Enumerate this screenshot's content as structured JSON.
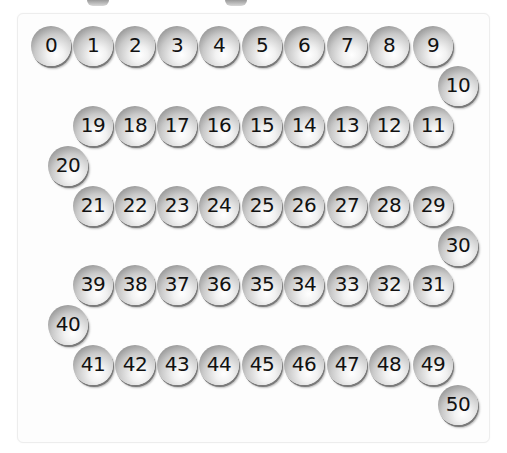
{
  "balls": [
    {
      "n": "0",
      "x": 51,
      "y": 46
    },
    {
      "n": "1",
      "x": 93,
      "y": 46
    },
    {
      "n": "2",
      "x": 135,
      "y": 46
    },
    {
      "n": "3",
      "x": 177,
      "y": 46
    },
    {
      "n": "4",
      "x": 219,
      "y": 46
    },
    {
      "n": "5",
      "x": 262,
      "y": 46
    },
    {
      "n": "6",
      "x": 304,
      "y": 46
    },
    {
      "n": "7",
      "x": 347,
      "y": 46
    },
    {
      "n": "8",
      "x": 389,
      "y": 46
    },
    {
      "n": "9",
      "x": 433,
      "y": 46
    },
    {
      "n": "10",
      "x": 458,
      "y": 86
    },
    {
      "n": "11",
      "x": 433,
      "y": 126
    },
    {
      "n": "12",
      "x": 389,
      "y": 126
    },
    {
      "n": "13",
      "x": 347,
      "y": 126
    },
    {
      "n": "14",
      "x": 304,
      "y": 126
    },
    {
      "n": "15",
      "x": 262,
      "y": 126
    },
    {
      "n": "16",
      "x": 219,
      "y": 126
    },
    {
      "n": "17",
      "x": 177,
      "y": 126
    },
    {
      "n": "18",
      "x": 135,
      "y": 126
    },
    {
      "n": "19",
      "x": 93,
      "y": 126
    },
    {
      "n": "20",
      "x": 68,
      "y": 166
    },
    {
      "n": "21",
      "x": 93,
      "y": 206
    },
    {
      "n": "22",
      "x": 135,
      "y": 206
    },
    {
      "n": "23",
      "x": 177,
      "y": 206
    },
    {
      "n": "24",
      "x": 219,
      "y": 206
    },
    {
      "n": "25",
      "x": 262,
      "y": 206
    },
    {
      "n": "26",
      "x": 304,
      "y": 206
    },
    {
      "n": "27",
      "x": 347,
      "y": 206
    },
    {
      "n": "28",
      "x": 389,
      "y": 206
    },
    {
      "n": "29",
      "x": 433,
      "y": 206
    },
    {
      "n": "30",
      "x": 458,
      "y": 246
    },
    {
      "n": "31",
      "x": 433,
      "y": 285
    },
    {
      "n": "32",
      "x": 389,
      "y": 285
    },
    {
      "n": "33",
      "x": 347,
      "y": 285
    },
    {
      "n": "34",
      "x": 304,
      "y": 285
    },
    {
      "n": "35",
      "x": 262,
      "y": 285
    },
    {
      "n": "36",
      "x": 219,
      "y": 285
    },
    {
      "n": "37",
      "x": 177,
      "y": 285
    },
    {
      "n": "38",
      "x": 135,
      "y": 285
    },
    {
      "n": "39",
      "x": 93,
      "y": 285
    },
    {
      "n": "40",
      "x": 68,
      "y": 325
    },
    {
      "n": "41",
      "x": 93,
      "y": 365
    },
    {
      "n": "42",
      "x": 135,
      "y": 365
    },
    {
      "n": "43",
      "x": 177,
      "y": 365
    },
    {
      "n": "44",
      "x": 219,
      "y": 365
    },
    {
      "n": "45",
      "x": 262,
      "y": 365
    },
    {
      "n": "46",
      "x": 304,
      "y": 365
    },
    {
      "n": "47",
      "x": 347,
      "y": 365
    },
    {
      "n": "48",
      "x": 389,
      "y": 365
    },
    {
      "n": "49",
      "x": 433,
      "y": 365
    },
    {
      "n": "50",
      "x": 458,
      "y": 405
    }
  ],
  "top_stubs": [
    {
      "x": 98
    },
    {
      "x": 236
    }
  ]
}
